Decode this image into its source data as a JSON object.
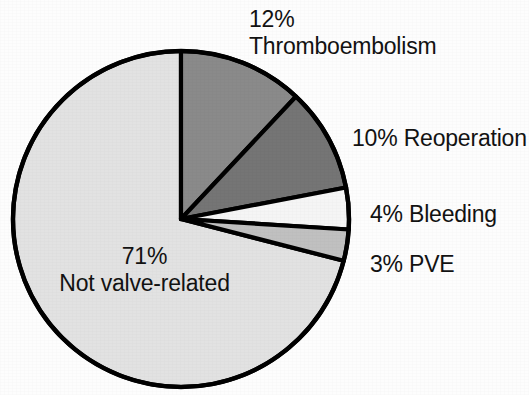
{
  "chart_data": {
    "type": "pie",
    "title": "",
    "subtitle": "",
    "xlabel": "",
    "ylabel": "",
    "legend_position": "none",
    "grid": false,
    "units": "percent",
    "start_angle_deg": 0,
    "direction": "clockwise",
    "total": 100,
    "categories": [
      "Thromboembolism",
      "Reoperation",
      "Bleeding",
      "PVE",
      "Not valve-related"
    ],
    "values": [
      12,
      10,
      4,
      3,
      71
    ],
    "slices": [
      {
        "label": "Thromboembolism",
        "value": 12,
        "percent_text": "12%",
        "color": "#8a8a8a",
        "label_position": "outside-top-right"
      },
      {
        "label": "Reoperation",
        "value": 10,
        "percent_text": "10%",
        "color": "#757575",
        "label_position": "outside-right"
      },
      {
        "label": "Bleeding",
        "value": 4,
        "percent_text": "4%",
        "color": "#f5f5f5",
        "label_position": "outside-right"
      },
      {
        "label": "PVE",
        "value": 3,
        "percent_text": "3%",
        "color": "#c0c0c0",
        "label_position": "outside-right"
      },
      {
        "label": "Not valve-related",
        "value": 71,
        "percent_text": "71%",
        "color": "#e2e2e2",
        "label_position": "inside-left"
      }
    ],
    "stroke_color": "#000000",
    "background_color": "#fdfdfd"
  },
  "labels": {
    "thromboembolism": {
      "percent": "12%",
      "name": "Thromboembolism"
    },
    "reoperation": {
      "percent": "10%",
      "name": "Reoperation"
    },
    "bleeding": {
      "percent": "4%",
      "name": "Bleeding"
    },
    "pve": {
      "percent": "3%",
      "name": "PVE"
    },
    "not_valve_related": {
      "percent": "71%",
      "name": "Not valve-related"
    }
  }
}
